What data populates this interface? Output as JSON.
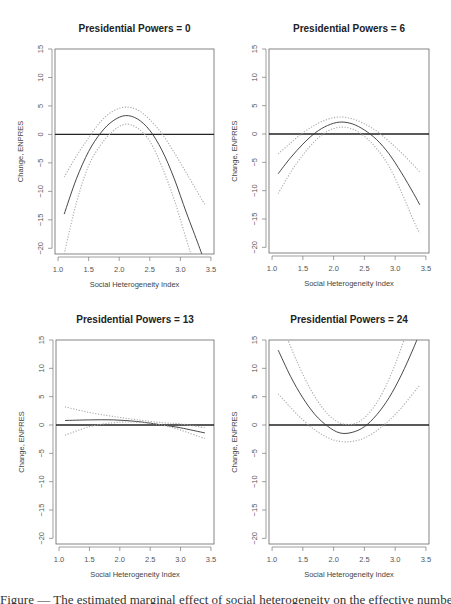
{
  "figure": {
    "caption_visible": "Figure — The estimated marginal effect of social heterogeneity on the effective number of presidential candidates"
  },
  "chart_data": [
    {
      "type": "line",
      "title": "Presidential Powers = 0",
      "xlabel": "Social Heterogeneity Index",
      "ylabel": "Change, ENPRES",
      "xlim": [
        0.95,
        3.55
      ],
      "ylim": [
        -21,
        15
      ],
      "xticks": [
        1.0,
        1.5,
        2.0,
        2.5,
        3.0,
        3.5
      ],
      "yticks": [
        15,
        10,
        5,
        0,
        -5,
        -10,
        -15,
        -20
      ],
      "grid": false,
      "reference_line_y": 0,
      "series": [
        {
          "name": "estimate",
          "style": "solid",
          "x": [
            1.1,
            1.3,
            1.5,
            1.7,
            1.9,
            2.1,
            2.3,
            2.5,
            2.7,
            2.9,
            3.1,
            3.3,
            3.4
          ],
          "y": [
            -14.0,
            -7.8,
            -3.0,
            0.3,
            2.4,
            3.3,
            2.7,
            0.7,
            -2.8,
            -7.8,
            -13.8,
            -19.5,
            -22.5
          ]
        },
        {
          "name": "upper_ci",
          "style": "dotted",
          "x": [
            1.1,
            1.3,
            1.5,
            1.7,
            1.9,
            2.1,
            2.3,
            2.5,
            2.7,
            2.9,
            3.1,
            3.3,
            3.4
          ],
          "y": [
            -7.5,
            -3.8,
            -0.6,
            2.3,
            4.1,
            4.8,
            4.3,
            2.6,
            0.1,
            -3.2,
            -6.8,
            -10.5,
            -12.3
          ]
        },
        {
          "name": "lower_ci",
          "style": "dotted",
          "x": [
            1.1,
            1.3,
            1.5,
            1.7,
            1.9,
            2.1,
            2.3,
            2.5,
            2.7,
            2.9,
            3.1,
            3.2
          ],
          "y": [
            -21.0,
            -12.0,
            -5.5,
            -1.8,
            0.6,
            1.8,
            1.1,
            -1.2,
            -5.7,
            -11.5,
            -18.5,
            -22.0
          ]
        }
      ]
    },
    {
      "type": "line",
      "title": "Presidential Powers = 6",
      "xlabel": "Social Heterogeneity Index",
      "ylabel": "Change, ENPRES",
      "xlim": [
        0.95,
        3.55
      ],
      "ylim": [
        -21,
        15
      ],
      "xticks": [
        1.0,
        1.5,
        2.0,
        2.5,
        3.0,
        3.5
      ],
      "yticks": [
        15,
        10,
        5,
        0,
        -5,
        -10,
        -15,
        -20
      ],
      "grid": false,
      "reference_line_y": 0,
      "series": [
        {
          "name": "estimate",
          "style": "solid",
          "x": [
            1.1,
            1.3,
            1.5,
            1.7,
            1.9,
            2.1,
            2.3,
            2.5,
            2.7,
            2.9,
            3.1,
            3.3,
            3.4
          ],
          "y": [
            -7.0,
            -4.2,
            -1.8,
            0.2,
            1.5,
            2.1,
            1.8,
            0.7,
            -1.0,
            -3.5,
            -6.8,
            -10.5,
            -12.5
          ]
        },
        {
          "name": "upper_ci",
          "style": "dotted",
          "x": [
            1.1,
            1.3,
            1.5,
            1.7,
            1.9,
            2.1,
            2.3,
            2.5,
            2.7,
            2.9,
            3.1,
            3.3,
            3.4
          ],
          "y": [
            -3.5,
            -1.6,
            0.2,
            1.6,
            2.6,
            3.0,
            2.7,
            1.8,
            0.5,
            -1.3,
            -3.3,
            -5.5,
            -6.7
          ]
        },
        {
          "name": "lower_ci",
          "style": "dotted",
          "x": [
            1.1,
            1.3,
            1.5,
            1.7,
            1.9,
            2.1,
            2.3,
            2.5,
            2.7,
            2.9,
            3.1,
            3.3,
            3.4
          ],
          "y": [
            -10.5,
            -6.8,
            -3.7,
            -1.2,
            0.5,
            1.2,
            0.9,
            -0.4,
            -2.6,
            -5.7,
            -10.2,
            -15.3,
            -17.5
          ]
        }
      ]
    },
    {
      "type": "line",
      "title": "Presidential Powers = 13",
      "xlabel": "Social Heterogeneity Index",
      "ylabel": "Change, ENPRES",
      "xlim": [
        0.95,
        3.55
      ],
      "ylim": [
        -21,
        15
      ],
      "xticks": [
        1.0,
        1.5,
        2.0,
        2.5,
        3.0,
        3.5
      ],
      "yticks": [
        15,
        10,
        5,
        0,
        -5,
        -10,
        -15,
        -20
      ],
      "grid": false,
      "reference_line_y": 0,
      "series": [
        {
          "name": "estimate",
          "style": "solid",
          "x": [
            1.1,
            1.5,
            1.9,
            2.3,
            2.7,
            3.0,
            3.4
          ],
          "y": [
            0.8,
            0.9,
            0.9,
            0.6,
            0.0,
            -0.5,
            -1.4
          ]
        },
        {
          "name": "upper_ci",
          "style": "dotted",
          "x": [
            1.1,
            1.5,
            1.9,
            2.3,
            2.7,
            3.0,
            3.4
          ],
          "y": [
            3.2,
            2.2,
            1.5,
            0.9,
            0.4,
            0.2,
            -0.5
          ]
        },
        {
          "name": "lower_ci",
          "style": "dotted",
          "x": [
            1.1,
            1.5,
            1.9,
            2.3,
            2.7,
            3.0,
            3.4
          ],
          "y": [
            -1.8,
            -0.3,
            0.4,
            0.5,
            0.0,
            -0.9,
            -2.4
          ]
        }
      ]
    },
    {
      "type": "line",
      "title": "Presidential Powers = 24",
      "xlabel": "Social Heterogeneity Index",
      "ylabel": "Change, ENPRES",
      "xlim": [
        0.95,
        3.55
      ],
      "ylim": [
        -21,
        15
      ],
      "xticks": [
        1.0,
        1.5,
        2.0,
        2.5,
        3.0,
        3.5
      ],
      "yticks": [
        15,
        10,
        5,
        0,
        -5,
        -10,
        -15,
        -20
      ],
      "grid": false,
      "reference_line_y": 0,
      "series": [
        {
          "name": "estimate",
          "style": "solid",
          "x": [
            1.1,
            1.3,
            1.5,
            1.7,
            1.9,
            2.1,
            2.3,
            2.5,
            2.7,
            2.9,
            3.1,
            3.3,
            3.4
          ],
          "y": [
            13.2,
            8.6,
            4.8,
            1.8,
            -0.2,
            -1.4,
            -1.3,
            -0.3,
            1.8,
            4.8,
            8.8,
            13.6,
            16.4
          ]
        },
        {
          "name": "upper_ci",
          "style": "dotted",
          "x": [
            1.25,
            1.4,
            1.6,
            1.8,
            2.0,
            2.2,
            2.4,
            2.6,
            2.8,
            3.0,
            3.15
          ],
          "y": [
            15.2,
            11.3,
            6.8,
            3.3,
            1.0,
            0.1,
            0.5,
            2.4,
            5.8,
            10.7,
            15.2
          ]
        },
        {
          "name": "lower_ci",
          "style": "dotted",
          "x": [
            1.1,
            1.3,
            1.5,
            1.7,
            1.9,
            2.1,
            2.3,
            2.5,
            2.7,
            2.9,
            3.1,
            3.3,
            3.4
          ],
          "y": [
            5.5,
            3.1,
            0.9,
            -0.9,
            -2.2,
            -2.9,
            -2.9,
            -2.3,
            -1.0,
            0.8,
            3.0,
            5.7,
            7.0
          ]
        }
      ]
    }
  ]
}
